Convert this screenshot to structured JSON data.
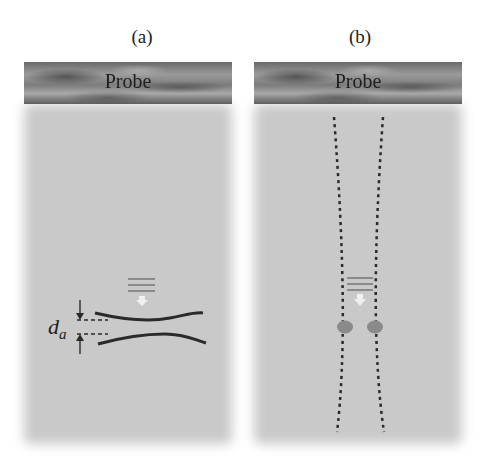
{
  "panels": [
    {
      "id": "a",
      "label": "(a)",
      "probe_label": "Probe",
      "annotation": "d",
      "annotation_sub": "a"
    },
    {
      "id": "b",
      "label": "(b)",
      "probe_label": "Probe"
    }
  ],
  "colors": {
    "probe": "#7a7a7a",
    "medium": "#c9c9c9",
    "line": "#2a2a2a",
    "dot": "#8a8a8a",
    "arrow": "#f2f2f2"
  }
}
